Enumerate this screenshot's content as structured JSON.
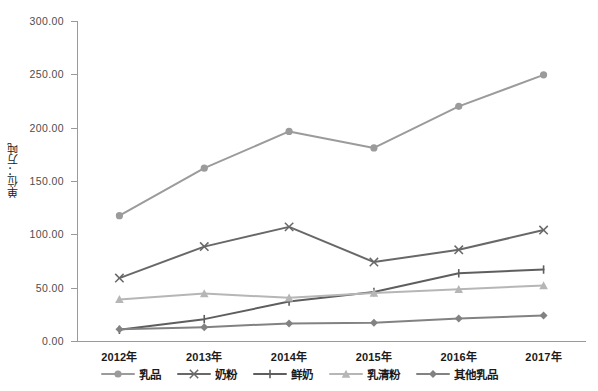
{
  "chart_data": {
    "type": "line",
    "title": "",
    "xlabel": "",
    "ylabel": "单位：万吨",
    "categories": [
      "2012年",
      "2013年",
      "2014年",
      "2015年",
      "2016年",
      "2017年"
    ],
    "ylim": [
      0,
      300
    ],
    "yticks": [
      "0.00",
      "50.00",
      "100.00",
      "150.00",
      "200.00",
      "250.00",
      "300.00"
    ],
    "ytick_values": [
      0,
      50,
      100,
      150,
      200,
      250,
      300
    ],
    "grid": false,
    "legend_position": "bottom",
    "series": [
      {
        "name": "乳品",
        "marker": "circle",
        "color": "#9b9b9b",
        "values": [
          117.5,
          162.0,
          196.5,
          181.0,
          220.0,
          249.5
        ]
      },
      {
        "name": "奶粉",
        "marker": "x",
        "color": "#686868",
        "values": [
          59.0,
          88.5,
          107.0,
          74.0,
          85.5,
          104.0
        ]
      },
      {
        "name": "鲜奶",
        "marker": "dash",
        "color": "#5e5e5e",
        "values": [
          10.5,
          20.5,
          37.0,
          46.0,
          63.5,
          67.0
        ]
      },
      {
        "name": "乳清粉",
        "marker": "triangle",
        "color": "#b6b6b6",
        "values": [
          39.0,
          44.5,
          40.5,
          45.0,
          48.5,
          52.0
        ]
      },
      {
        "name": "其他乳品",
        "marker": "diamond",
        "color": "#828282",
        "values": [
          11.0,
          13.0,
          16.5,
          17.0,
          21.0,
          24.0
        ]
      }
    ]
  },
  "axis": {
    "y_title": "单位：万吨"
  }
}
